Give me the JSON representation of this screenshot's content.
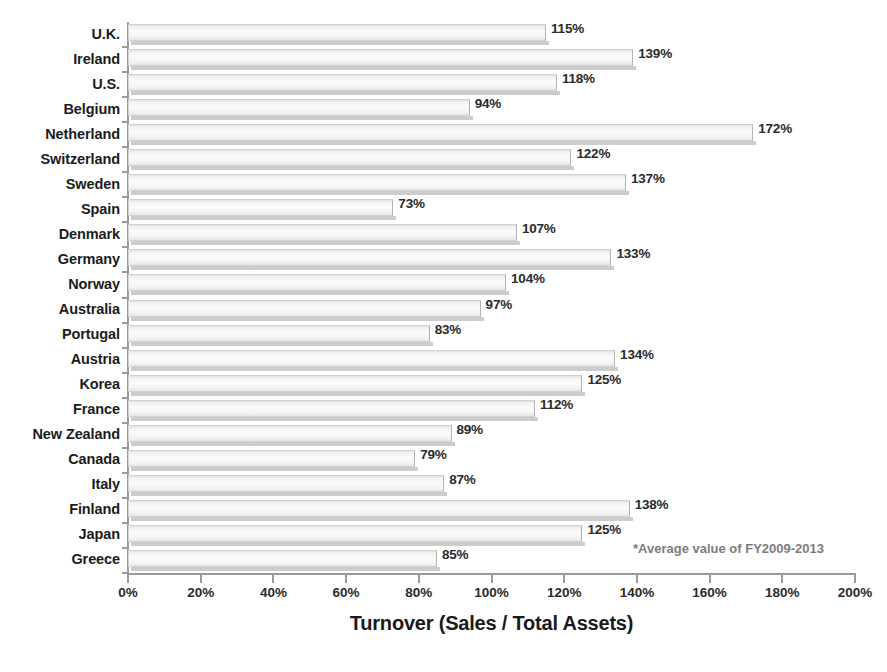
{
  "chart_data": {
    "type": "bar",
    "orientation": "horizontal",
    "title": "",
    "xlabel": "Turnover  (Sales / Total Assets)",
    "ylabel": "",
    "xlim": [
      0,
      200
    ],
    "xtick_labels": [
      "0%",
      "20%",
      "40%",
      "60%",
      "80%",
      "100%",
      "120%",
      "140%",
      "160%",
      "180%",
      "200%"
    ],
    "xtick_values": [
      0,
      20,
      40,
      60,
      80,
      100,
      120,
      140,
      160,
      180,
      200
    ],
    "grid": false,
    "legend": false,
    "value_suffix": "%",
    "categories": [
      "U.K.",
      "Ireland",
      "U.S.",
      "Belgium",
      "Netherland",
      "Switzerland",
      "Sweden",
      "Spain",
      "Denmark",
      "Germany",
      "Norway",
      "Australia",
      "Portugal",
      "Austria",
      "Korea",
      "France",
      "New Zealand",
      "Canada",
      "Italy",
      "Finland",
      "Japan",
      "Greece"
    ],
    "values": [
      115,
      139,
      118,
      94,
      172,
      122,
      137,
      73,
      107,
      133,
      104,
      97,
      83,
      134,
      125,
      112,
      89,
      79,
      87,
      138,
      125,
      85
    ],
    "data_labels": [
      "115%",
      "139%",
      "118%",
      "94%",
      "172%",
      "122%",
      "137%",
      "73%",
      "107%",
      "133%",
      "104%",
      "97%",
      "83%",
      "134%",
      "125%",
      "112%",
      "89%",
      "79%",
      "87%",
      "138%",
      "125%",
      "85%"
    ],
    "annotations": [
      "*Average value of FY2009-2013"
    ]
  },
  "footnote": "*Average value of FY2009-2013",
  "colors": {
    "bar_fill": "#f4f4f4",
    "bar_edge": "#d2d2d2",
    "bar_shadow": "#b9b9b9",
    "axis": "#9a9a9a",
    "text": "#1b1b1b",
    "footnote_text": "#7d7d7d",
    "background": "#ffffff"
  }
}
